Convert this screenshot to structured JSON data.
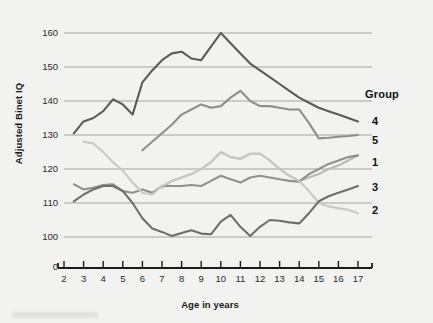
{
  "chart_data": {
    "type": "line",
    "title": "",
    "xlabel": "Age in years",
    "ylabel": "Adjusted Binet IQ",
    "xlim": [
      2,
      17
    ],
    "ylim": [
      95,
      163
    ],
    "yticks": [
      100,
      110,
      120,
      130,
      140,
      150,
      160
    ],
    "ytick_labels": [
      "100",
      "110",
      "120",
      "130",
      "140",
      "150",
      "160"
    ],
    "y_origin_label": "0",
    "xticks": [
      2,
      3,
      4,
      5,
      6,
      7,
      8,
      9,
      10,
      11,
      12,
      13,
      14,
      15,
      16,
      17
    ],
    "xtick_labels": [
      "2",
      "3",
      "4",
      "5",
      "6",
      "7",
      "8",
      "9",
      "10",
      "11",
      "12",
      "13",
      "14",
      "15",
      "16",
      "17"
    ],
    "grid": true,
    "legend_title": "Group",
    "legend_position": "right",
    "x": [
      2.5,
      3,
      3.5,
      4,
      4.5,
      5,
      5.5,
      6,
      6.5,
      7,
      7.5,
      8,
      8.5,
      9,
      9.5,
      10,
      10.5,
      11,
      11.5,
      12,
      12.5,
      13,
      13.5,
      14,
      14.5,
      15,
      15.5,
      16,
      16.5,
      17
    ],
    "series": [
      {
        "name": "4",
        "label": "4",
        "color": "#5a5a5a",
        "values": [
          130.5,
          134,
          135,
          137,
          140.5,
          139,
          136,
          145.5,
          149,
          152,
          154,
          154.5,
          152.5,
          152,
          156,
          160,
          157,
          154,
          151,
          149,
          147,
          145,
          143,
          141,
          139.5,
          138,
          137,
          136,
          135,
          134
        ]
      },
      {
        "name": "5",
        "label": "5",
        "color": "#8e8e8e",
        "values": [
          null,
          null,
          null,
          null,
          null,
          null,
          null,
          125.5,
          128,
          130.5,
          133,
          136,
          137.5,
          139,
          138,
          138.5,
          141,
          143,
          140,
          138.5,
          138.5,
          138,
          137.5,
          137.5,
          133.5,
          129,
          129.2,
          129.5,
          129.7,
          130
        ]
      },
      {
        "name": "1",
        "label": "1",
        "color": "#b9b9b9",
        "values": [
          null,
          null,
          null,
          null,
          null,
          null,
          null,
          null,
          null,
          114.5,
          116.5,
          117.5,
          118.5,
          120,
          122,
          125,
          123.5,
          123,
          124.5,
          124.5,
          122.5,
          120,
          118,
          116.5,
          117.5,
          118.5,
          120,
          121,
          122.5,
          124
        ]
      },
      {
        "name": "3",
        "label": "3",
        "color": "#909090",
        "values": [
          115.5,
          114,
          114.5,
          115.3,
          115.5,
          113.5,
          113,
          114,
          113,
          115,
          115,
          115,
          115.3,
          115,
          116.5,
          118,
          117,
          116,
          117.5,
          118,
          117.5,
          117,
          116.5,
          116.3,
          118.5,
          120,
          121.5,
          122.5,
          123.5,
          124
        ]
      },
      {
        "name": "2",
        "label": "2",
        "color": "#c8c8c8",
        "values": [
          null,
          128,
          127.5,
          125,
          122,
          119.5,
          116,
          113,
          112.5,
          115,
          116.5,
          117.5,
          118.5,
          120,
          122,
          125,
          123.5,
          123,
          124.5,
          124.5,
          122.5,
          120,
          118,
          116.5,
          113.5,
          110,
          109,
          108.5,
          108,
          107
        ]
      }
    ],
    "series_lower": [
      {
        "name": "group-3-lower",
        "label": "3",
        "color": "#6e6e6e",
        "values": [
          110.5,
          112.5,
          114,
          115,
          115,
          113.5,
          110,
          105.5,
          102.5,
          101.5,
          100.3,
          101.2,
          102,
          101,
          100.8,
          104.5,
          106.5,
          103,
          100.3,
          103,
          105,
          104.8,
          104.3,
          104,
          107,
          110.5,
          112,
          113,
          114,
          115
        ]
      }
    ]
  },
  "legend": {
    "title": "Group",
    "entries": [
      {
        "label": "4",
        "color": "#5a5a5a"
      },
      {
        "label": "5",
        "color": "#8e8e8e"
      },
      {
        "label": "1",
        "color": "#b9b9b9"
      },
      {
        "label": "3",
        "color": "#6e6e6e"
      },
      {
        "label": "2",
        "color": "#c8c8c8"
      }
    ]
  },
  "axes": {
    "y_title": "Adjusted Binet IQ",
    "x_title": "Age in years",
    "y_origin": "0",
    "y_labels": [
      "160",
      "150",
      "140",
      "130",
      "120",
      "110",
      "100"
    ],
    "x_labels": [
      "2",
      "3",
      "4",
      "5",
      "6",
      "7",
      "8",
      "9",
      "10",
      "11",
      "12",
      "13",
      "14",
      "15",
      "16",
      "17"
    ]
  }
}
